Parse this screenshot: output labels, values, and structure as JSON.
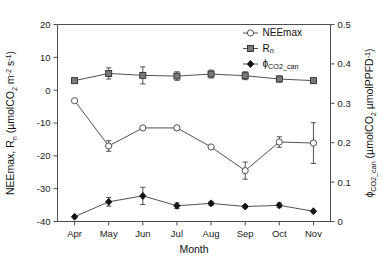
{
  "chart_data": {
    "type": "line",
    "title": "",
    "xlabel": "Month",
    "ylabel": "NEEmax, Rn (umolCO2 m-2 s-1)",
    "y2label": "phiCO2_can (umolCO2 umolPPFD-1)",
    "categories": [
      "Apr",
      "May",
      "Jun",
      "Jul",
      "Aug",
      "Sep",
      "Oct",
      "Nov"
    ],
    "ylim": [
      -40,
      20
    ],
    "yticks": [
      20,
      10,
      0,
      -10,
      -20,
      -30,
      -40
    ],
    "ytick_labels": [
      "20",
      "10",
      "0",
      "-10",
      "-20",
      "-30",
      "-40"
    ],
    "y2lim": [
      0,
      0.5
    ],
    "y2ticks": [
      0.5,
      0.4,
      0.3,
      0.2,
      0.1,
      0
    ],
    "y2tick_labels": [
      "0.5",
      "0.4",
      "0.3",
      "0.2",
      "0.1",
      "0"
    ],
    "grid": false,
    "legend_position": "top-right",
    "series": [
      {
        "name": "NEEmax",
        "axis": "left",
        "marker": "open-circle",
        "values": [
          -3.2,
          -17.0,
          -11.5,
          -11.5,
          -17.3,
          -24.5,
          -15.8,
          -16.1
        ],
        "errors": [
          0,
          1.6,
          0,
          0,
          0,
          2.6,
          1.6,
          6.2
        ]
      },
      {
        "name": "Rn",
        "axis": "left",
        "marker": "filled-square",
        "values": [
          2.9,
          5.1,
          4.5,
          4.3,
          4.9,
          4.4,
          3.4,
          2.9
        ],
        "errors": [
          0,
          1.7,
          2.6,
          1.3,
          1.2,
          1.2,
          0.9,
          0
        ]
      },
      {
        "name": "phiCO2_can",
        "axis": "right",
        "marker": "filled-diamond",
        "values": [
          0.012,
          0.05,
          0.065,
          0.04,
          0.046,
          0.038,
          0.041,
          0.026
        ],
        "errors": [
          0,
          0.011,
          0.022,
          0.007,
          0.005,
          0.003,
          0.006,
          0
        ]
      }
    ]
  },
  "legend": {
    "items": [
      {
        "label": "NEEmax",
        "marker": "open-circle"
      },
      {
        "label_base": "R",
        "label_sub": "n",
        "marker": "filled-square"
      },
      {
        "label_base": "ϕ",
        "label_sub": "CO2_can",
        "marker": "filled-diamond"
      }
    ]
  },
  "axis_titles": {
    "x": "Month",
    "y_left_part1": "NEEmax, R",
    "y_left_sub1": "n",
    "y_left_part2": " (µmolCO",
    "y_left_sub2": "2",
    "y_left_part3": " m",
    "y_left_sup1": "-2",
    "y_left_part4": " s",
    "y_left_sup2": "-1",
    "y_left_part5": ")",
    "y_right_part1": "ϕ",
    "y_right_sub1": "CO2_can",
    "y_right_part2": " (µmolCO",
    "y_right_sub2": "2",
    "y_right_part3": " µmolPPFD",
    "y_right_sup1": "-1",
    "y_right_part4": ")"
  }
}
